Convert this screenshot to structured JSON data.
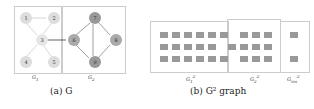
{
  "figure_a": {
    "caption": "(a) G",
    "g1_label": "G1",
    "g2_label": "G2",
    "nodes": [
      {
        "id": "1",
        "x": 18,
        "y": 12,
        "c": "#ddd"
      },
      {
        "id": "2",
        "x": 46,
        "y": 12,
        "c": "#ddd"
      },
      {
        "id": "3",
        "x": 34,
        "y": 34,
        "c": "#e6e6e6"
      },
      {
        "id": "4",
        "x": 18,
        "y": 56,
        "c": "#ddd"
      },
      {
        "id": "5",
        "x": 46,
        "y": 56,
        "c": "#ddd"
      },
      {
        "id": "6",
        "x": 66,
        "y": 34,
        "c": "#aaa"
      },
      {
        "id": "7",
        "x": 87,
        "y": 12,
        "c": "#999"
      },
      {
        "id": "8",
        "x": 108,
        "y": 34,
        "c": "#aaa"
      },
      {
        "id": "9",
        "x": 87,
        "y": 56,
        "c": "#999"
      }
    ]
  },
  "figure_b": {
    "caption": "(b) G² graph",
    "labels": [
      "G1²",
      "G2²",
      "G²ms"
    ]
  }
}
